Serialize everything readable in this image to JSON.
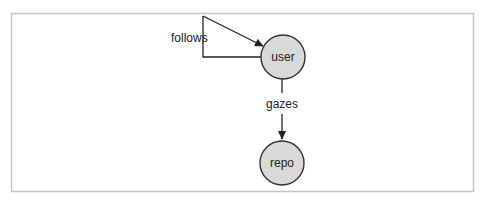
{
  "diagram": {
    "type": "graph",
    "nodes": [
      {
        "id": "user",
        "label": "user",
        "cx": 283,
        "cy": 57,
        "r": 22,
        "fill": "#d9d9d9",
        "stroke": "#333333"
      },
      {
        "id": "repo",
        "label": "repo",
        "cx": 282,
        "cy": 163,
        "r": 22,
        "fill": "#d9d9d9",
        "stroke": "#333333"
      }
    ],
    "edges": [
      {
        "from": "user",
        "to": "user",
        "label": "follows",
        "kind": "self-loop"
      },
      {
        "from": "user",
        "to": "repo",
        "label": "gazes",
        "kind": "directed"
      }
    ],
    "frame": {
      "border_color": "#bfbfbf"
    }
  }
}
